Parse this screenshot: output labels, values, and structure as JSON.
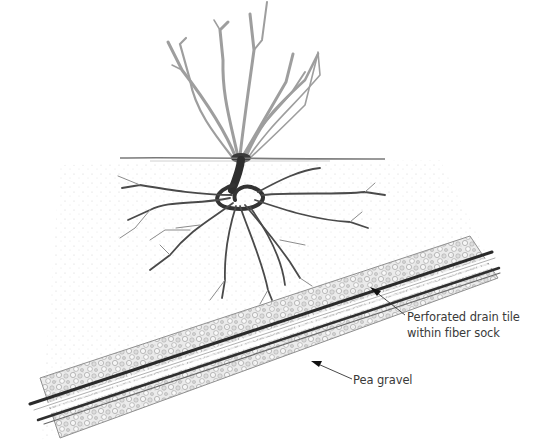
{
  "diagram": {
    "labels": {
      "drain_tile": {
        "line1": "Perforated drain tile",
        "line2": "within fiber sock"
      },
      "pea_gravel": "Pea gravel"
    },
    "elements": [
      {
        "name": "shrub-stems",
        "description": "bare branching stems above ground"
      },
      {
        "name": "soil-line",
        "description": "horizontal ground surface line"
      },
      {
        "name": "root-system",
        "description": "spreading roots below ground"
      },
      {
        "name": "gravel-trench",
        "description": "diagonal band of pea gravel"
      },
      {
        "name": "drain-pipe",
        "description": "perforated drain tile inside fiber sock running through gravel"
      }
    ],
    "colors": {
      "ink": "#2a2a2a",
      "stem_light": "#bdbdbd",
      "gravel": "#9a9a9a",
      "background": "#ffffff"
    }
  }
}
